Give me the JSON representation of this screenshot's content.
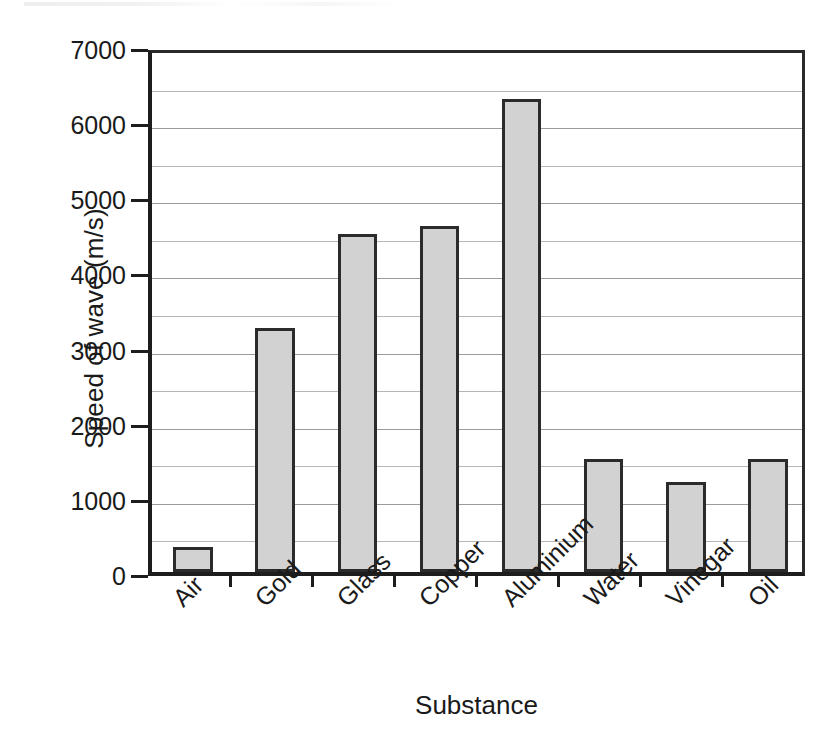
{
  "chart_data": {
    "type": "bar",
    "title": "",
    "subtitle": "",
    "xlabel": "Substance",
    "ylabel": "Speed of wave (m/s)",
    "categories": [
      "Air",
      "Gold",
      "Glass",
      "Copper",
      "Aluminium",
      "Water",
      "Vinegar",
      "Oil"
    ],
    "values": [
      330,
      3250,
      4500,
      4600,
      6300,
      1500,
      1200,
      1500
    ],
    "series": [
      {
        "name": "Speed of wave",
        "values": [
          330,
          3250,
          4500,
          4600,
          6300,
          1500,
          1200,
          1500
        ]
      }
    ],
    "ylim": [
      0,
      7000
    ],
    "y_major_ticks": [
      0,
      1000,
      2000,
      3000,
      4000,
      5000,
      6000,
      7000
    ],
    "y_tick_labels": [
      "0",
      "1000",
      "2000",
      "3000",
      "4000",
      "5000",
      "6000",
      "7000"
    ],
    "y_minor_step": 500,
    "grid": "horizontal",
    "legend": "none",
    "bar_fill_color": "#d2d2d2",
    "bar_border_color": "#2b2b2b",
    "gridline_color": "#9a9a9a",
    "axis_color": "#1d1d1d",
    "background_color": "#ffffff",
    "x_tick_label_rotation": -45,
    "annotations": []
  },
  "axes": {
    "y_title": "Speed of wave (m/s)",
    "x_title": "Substance"
  }
}
